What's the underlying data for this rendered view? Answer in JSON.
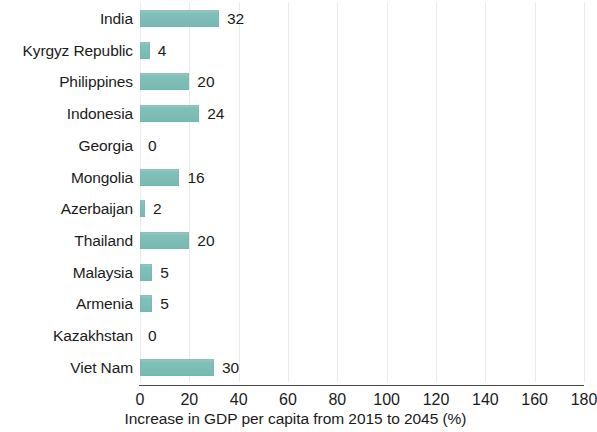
{
  "chart_data": {
    "type": "bar",
    "orientation": "horizontal",
    "title": "",
    "subtitle": "",
    "xlabel": "Increase in GDP per capita from 2015 to 2045 (%)",
    "ylabel": "",
    "xlim": [
      0,
      180
    ],
    "xticks": [
      0,
      20,
      40,
      60,
      80,
      100,
      120,
      140,
      160,
      180
    ],
    "xtick_labels": [
      "0",
      "20",
      "40",
      "60",
      "80",
      "100",
      "120",
      "140",
      "160",
      "180"
    ],
    "grid": true,
    "grid_axis": "x",
    "legend": null,
    "legend_position": "none",
    "bar_color": "#7fc0b8",
    "categories": [
      "India",
      "Kyrgyz Republic",
      "Philippines",
      "Indonesia",
      "Georgia",
      "Mongolia",
      "Azerbaijan",
      "Thailand",
      "Malaysia",
      "Armenia",
      "Kazakhstan",
      "Viet Nam"
    ],
    "values": [
      32,
      4,
      20,
      24,
      0,
      16,
      2,
      20,
      5,
      5,
      0,
      30
    ],
    "value_labels": [
      "32",
      "4",
      "20",
      "24",
      "0",
      "16",
      "2",
      "20",
      "5",
      "5",
      "0",
      "30"
    ],
    "bars": [
      {
        "category": "India",
        "value": 32,
        "label": "32"
      },
      {
        "category": "Kyrgyz Republic",
        "value": 4,
        "label": "4"
      },
      {
        "category": "Philippines",
        "value": 20,
        "label": "20"
      },
      {
        "category": "Indonesia",
        "value": 24,
        "label": "24"
      },
      {
        "category": "Georgia",
        "value": 0,
        "label": "0"
      },
      {
        "category": "Mongolia",
        "value": 16,
        "label": "16"
      },
      {
        "category": "Azerbaijan",
        "value": 2,
        "label": "2"
      },
      {
        "category": "Thailand",
        "value": 20,
        "label": "20"
      },
      {
        "category": "Malaysia",
        "value": 5,
        "label": "5"
      },
      {
        "category": "Armenia",
        "value": 5,
        "label": "5"
      },
      {
        "category": "Kazakhstan",
        "value": 0,
        "label": "0"
      },
      {
        "category": "Viet Nam",
        "value": 30,
        "label": "30"
      }
    ]
  }
}
